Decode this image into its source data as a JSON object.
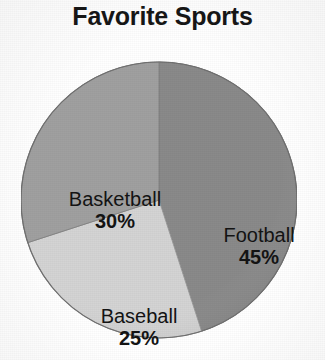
{
  "chart_data": {
    "type": "pie",
    "title": "Favorite Sports",
    "categories": [
      "Football",
      "Basketball",
      "Baseball"
    ],
    "values": [
      45,
      30,
      25
    ],
    "value_unit": "%",
    "labels": [
      {
        "name": "Football",
        "percent": "45%",
        "value": 45,
        "color": "#8a8a8a",
        "start_angle": 0,
        "end_angle": 162
      },
      {
        "name": "Basketball",
        "percent": "30%",
        "value": 30,
        "color": "#a0a0a0",
        "start_angle": 252,
        "end_angle": 360
      },
      {
        "name": "Baseball",
        "percent": "25%",
        "value": 25,
        "color": "#d4d4d4",
        "start_angle": 162,
        "end_angle": 252
      }
    ],
    "legend": "none",
    "legend_position": "inside-slices",
    "grid": false,
    "xlabel": "",
    "ylabel": "",
    "start_angle_deg": 0,
    "direction": "clockwise",
    "colors": {
      "football": "#8a8a8a",
      "basketball": "#a0a0a0",
      "baseball": "#d4d4d4",
      "outline": "#6f6f6f",
      "label_text": "#141414",
      "title_text": "#171717",
      "background": "#ffffff"
    }
  }
}
